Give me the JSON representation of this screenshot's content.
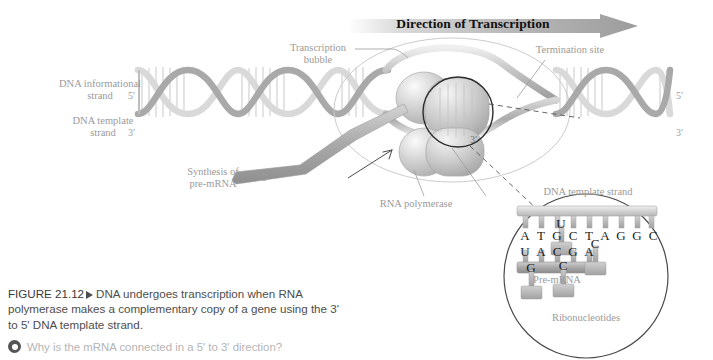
{
  "figure": {
    "number": "FIGURE 21.12",
    "caption": "DNA undergoes transcription when RNA polymerase makes a complementary copy of a gene using the 3' to 5' DNA template strand.",
    "question": "Why is the mRNA connected in a 5' to 3' direction?"
  },
  "banner": {
    "arrow_label": "Direction of Transcription"
  },
  "labels": {
    "informational_strand": "DNA informational\nstrand",
    "template_strand": "DNA template\nstrand",
    "transcription_bubble": "Transcription\nbubble",
    "termination_site": "Termination site",
    "rna_polymerase": "RNA polymerase",
    "synthesis": "Synthesis of\npre-mRNA"
  },
  "primes": {
    "dna_left_top": "5′",
    "dna_left_bottom": "3′",
    "dna_right_top": "5′",
    "dna_right_bottom": "3′",
    "mrna_left": "5′",
    "polymerase_three": "3′"
  },
  "inset": {
    "title": "DNA template strand",
    "premrna_label": "Pre-mRNA",
    "ribonucleotides_label": "Ribonucleotides",
    "template_bases": [
      "A",
      "T",
      "G",
      "C",
      "T",
      "A",
      "G",
      "G",
      "C"
    ],
    "mrna_bases": [
      "U",
      "A",
      "C",
      "G",
      "A"
    ],
    "free_ribonucleotides": [
      {
        "base": "U",
        "x": 88,
        "y": 28
      },
      {
        "base": "C",
        "x": 122,
        "y": 48
      },
      {
        "base": "G",
        "x": 58,
        "y": 72
      },
      {
        "base": "C",
        "x": 90,
        "y": 70
      }
    ]
  },
  "colors": {
    "helix_light": "#d8d8d8",
    "helix_mid": "#b4b4b4",
    "helix_dark": "#8e8e8e",
    "rung": "#cfcfcf",
    "polymerase": "#c9c9c9",
    "mrna_ribbon": "#b0b0b0",
    "label_gray": "#9a9a9a",
    "ink": "#111111",
    "bubble_outline": "#c0c0c0",
    "inset_outline": "#4a4a4a"
  }
}
